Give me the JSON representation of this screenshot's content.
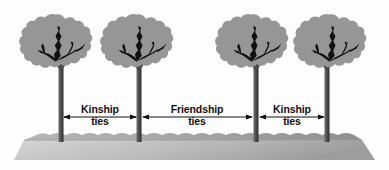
{
  "figure": {
    "name": "kinship-and-friendship-ties-among-trees-diagram",
    "background_color": "#fdfdfd",
    "width": 389,
    "height": 170
  },
  "palette": {
    "foliage": "#969696",
    "foliage_dark": "#8c8c8c",
    "branch": "#111111",
    "trunk_light": "#5e5e5e",
    "trunk_dark": "#2e2e2e",
    "ground_top_light": "#bcbcbc",
    "ground_top_dark": "#8e8e8e",
    "ground_face_light": "#d8d8d8",
    "ground_face_dark": "#a2a2a2",
    "arrow": "#111111",
    "text": "#111111"
  },
  "ground": {
    "label": "ground-slab",
    "top_y": 136,
    "front_left_x": 14,
    "front_right_x": 375,
    "bottom_y": 160
  },
  "trees": [
    {
      "id": "tree-1",
      "trunk_x": 61,
      "canopy_cx": 55,
      "canopy_cy": 44,
      "canopy_rx": 37,
      "canopy_ry": 31,
      "trunk_top": 62,
      "trunk_bottom": 142,
      "trunk_width": 5
    },
    {
      "id": "tree-2",
      "trunk_x": 139,
      "canopy_cx": 136,
      "canopy_cy": 44,
      "canopy_rx": 37,
      "canopy_ry": 31,
      "trunk_top": 62,
      "trunk_bottom": 142,
      "trunk_width": 5
    },
    {
      "id": "tree-3",
      "trunk_x": 256,
      "canopy_cx": 251,
      "canopy_cy": 44,
      "canopy_rx": 37,
      "canopy_ry": 31,
      "trunk_top": 62,
      "trunk_bottom": 142,
      "trunk_width": 5
    },
    {
      "id": "tree-4",
      "trunk_x": 327,
      "canopy_cx": 329,
      "canopy_cy": 44,
      "canopy_rx": 37,
      "canopy_ry": 31,
      "trunk_top": 62,
      "trunk_bottom": 142,
      "trunk_width": 5
    }
  ],
  "relations": [
    {
      "id": "relation-kinship-left",
      "line1": "Kinship",
      "line2": "ties",
      "from_tree": "tree-1",
      "to_tree": "tree-2",
      "x_start": 63,
      "x_end": 137,
      "arrow_y": 117,
      "label_cx": 100,
      "label_top": 104
    },
    {
      "id": "relation-friendship-middle",
      "line1": "Friendship",
      "line2": "ties",
      "from_tree": "tree-2",
      "to_tree": "tree-3",
      "x_start": 142,
      "x_end": 253,
      "arrow_y": 117,
      "label_cx": 197,
      "label_top": 104
    },
    {
      "id": "relation-kinship-right",
      "line1": "Kinship",
      "line2": "ties",
      "from_tree": "tree-3",
      "to_tree": "tree-4",
      "x_start": 259,
      "x_end": 325,
      "arrow_y": 117,
      "label_cx": 292,
      "label_top": 104
    }
  ]
}
